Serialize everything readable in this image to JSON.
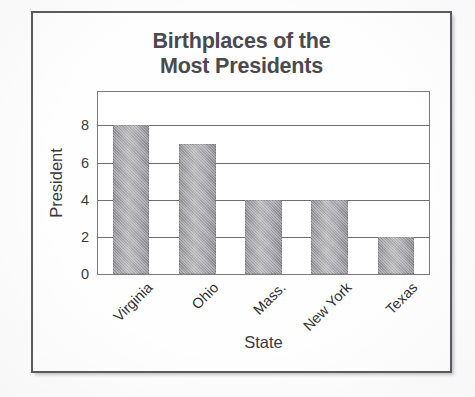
{
  "figure": {
    "title": "Birthplaces of the\nMost Presidents"
  },
  "chart_data": {
    "type": "bar",
    "title": "Birthplaces of the Most Presidents",
    "xlabel": "State",
    "ylabel": "President",
    "categories": [
      "Virginia",
      "Ohio",
      "Mass.",
      "New York",
      "Texas"
    ],
    "values": [
      8,
      7,
      4,
      4,
      2
    ],
    "ytick_labels": [
      "0",
      "2",
      "4",
      "6",
      "8"
    ],
    "yticks": [
      0,
      2,
      4,
      6,
      8
    ],
    "ylim": [
      0,
      9.8
    ],
    "xtick_rotation": -45,
    "grid": "horizontal",
    "legend": "none",
    "bar_fill": "#a8a8ac",
    "frame_color": "#5c5c60",
    "title_color": "#4a4a4e"
  }
}
